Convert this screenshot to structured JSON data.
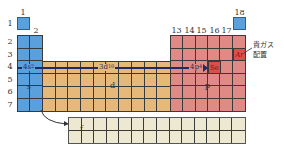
{
  "colors": {
    "s_block": "#5aa0dc",
    "d_block": "#e6b97a",
    "p_block": "#e08a86",
    "f_block": "#ece8d2",
    "highlight_cell": "#d9504c",
    "arrow": "#1f2a66"
  },
  "group_labels": {
    "g1": "1",
    "g2": "2",
    "g13": "13",
    "g14": "14",
    "g15": "15",
    "g16": "16",
    "g17": "17",
    "g18": "18"
  },
  "period_labels": [
    "1",
    "2",
    "3",
    "4",
    "5",
    "6",
    "7"
  ],
  "blocks": {
    "s": "s",
    "d": "d",
    "p": "p",
    "f": "f"
  },
  "configuration": {
    "s_part": "4s",
    "s_sup": "2",
    "d_part": "3d",
    "d_sup": "10",
    "p_part": "4p",
    "p_sup": "4",
    "target_element": "Se"
  },
  "noble_gas": {
    "element": "Ar",
    "note_line1": "貴ガス",
    "note_line2": "配置"
  }
}
